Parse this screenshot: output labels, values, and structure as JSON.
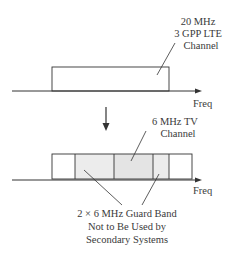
{
  "top": {
    "channel_label_lines": [
      "20 MHz",
      "3 GPP LTE",
      "Channel"
    ],
    "axis_label": "Freq"
  },
  "bottom": {
    "tv_label_lines": [
      "6 MHz TV",
      "Channel"
    ],
    "axis_label": "Freq",
    "guard_label_lines": [
      "2 × 6 MHz Guard Band",
      "Not to Be Used by",
      "Secondary Systems"
    ]
  },
  "colors": {
    "line": "#333333",
    "shade": "#ececec"
  }
}
